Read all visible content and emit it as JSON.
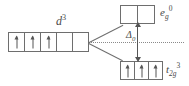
{
  "diagram": {
    "type": "crystal-field-splitting",
    "background_color": "#ffffff",
    "line_color": "#6e6e6e",
    "text_color": "#4a4a4a",
    "free_ion": {
      "label_base": "d",
      "label_superscript": "3",
      "cell_count": 5,
      "cells": [
        {
          "electron": true
        },
        {
          "electron": true
        },
        {
          "electron": true
        },
        {
          "electron": false
        },
        {
          "electron": false
        }
      ]
    },
    "upper_level": {
      "label_base": "e",
      "label_subscript": "g",
      "label_superscript": "0",
      "cell_count": 2,
      "cells": [
        {
          "electron": false
        },
        {
          "electron": false
        }
      ]
    },
    "lower_level": {
      "label_base": "t",
      "label_subscript": "2g",
      "label_superscript": "3",
      "cell_count": 3,
      "cells": [
        {
          "electron": true
        },
        {
          "electron": true
        },
        {
          "electron": true
        }
      ]
    },
    "splitting": {
      "label_base": "Δ",
      "label_subscript": "0"
    }
  }
}
